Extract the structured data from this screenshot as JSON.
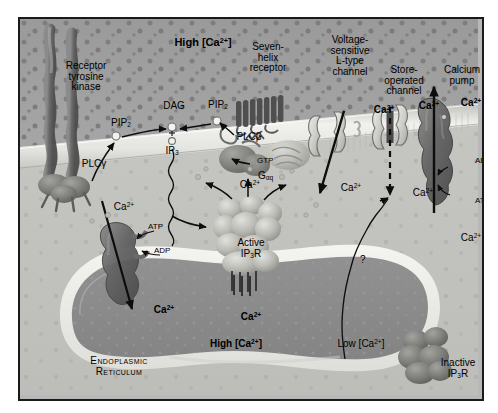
{
  "figure": {
    "compartments": {
      "extracellular_label": "High [Ca2+]",
      "extracellular_label_html": "High [Ca<sup>2+</sup>]",
      "cytoplasm_label": "Cytoplasm",
      "er_label_line1": "Endoplasmic",
      "er_label_line2": "Reticulum",
      "er_concentration": "High [Ca2+]",
      "er_concentration_html": "High [Ca<sup>2+</sup>]",
      "cytosol_concentration": "Low [Ca2+]",
      "cytosol_concentration_html": "Low [Ca<sup>2+</sup>]"
    },
    "proteins": [
      {
        "name": "receptor-tyrosine-kinase",
        "label_lines": [
          "Receptor",
          "tyrosine",
          "kinase"
        ]
      },
      {
        "name": "seven-helix-receptor",
        "label_lines": [
          "Seven-",
          "helix",
          "receptor"
        ]
      },
      {
        "name": "voltage-sensitive-l-type-channel",
        "label_lines": [
          "Voltage-",
          "sensitive",
          "L-type",
          "channel"
        ]
      },
      {
        "name": "store-operated-channel",
        "label_lines": [
          "Store-",
          "operated",
          "channel"
        ]
      },
      {
        "name": "calcium-pump",
        "label_lines": [
          "Calcium",
          "pump"
        ]
      },
      {
        "name": "active-ip3-receptor",
        "label_lines": [
          "Active",
          "IP3R"
        ]
      },
      {
        "name": "inactive-ip3-receptor",
        "label_lines": [
          "Inactive",
          "IP3R"
        ]
      }
    ],
    "molecules": {
      "pip2_left": "PIP2",
      "pip2_left_html": "PIP<sub>2</sub>",
      "pip2_right": "PIP2",
      "pip2_right_html": "PIP<sub>2</sub>",
      "dag": "DAG",
      "ip3": "IP3",
      "ip3_html": "IP<sub>3</sub>",
      "plc_gamma": "PLCγ",
      "plc_beta": "PLCβ",
      "gtp": "GTP",
      "g_alpha_q": "Gαq",
      "g_alpha_q_html": "G<sub>αq</sub>",
      "atp": "ATP",
      "adp": "ADP",
      "question_mark": "?"
    },
    "calcium_labels": {
      "ion": "Ca2+",
      "ion_html": "Ca<sup>2+</sup>",
      "active_ip3r_label": "Active",
      "ip3r_label": "IP3R",
      "ip3r_label_html": "IP<sub>3</sub>R",
      "inactive_label": "Inactive"
    },
    "ip3r_sublabels": {
      "active_line1": "Active",
      "active_line2_html": "IP<sub>3</sub>R",
      "inactive_line1": "Inactive",
      "inactive_line2_html": "IP<sub>3</sub>R"
    },
    "colors": {
      "extracellular": "#9c9c9c",
      "membrane": "#e6e6e2",
      "cytoplasm": "#c3c3c0",
      "er_lumen": "#8b8b8b",
      "er_rim": "#efefec",
      "protein_dark": "#6e6e6e",
      "protein_light": "#cfcfc9",
      "border": "#1a1a1a",
      "text": "#000000",
      "page": "#ffffff"
    }
  }
}
